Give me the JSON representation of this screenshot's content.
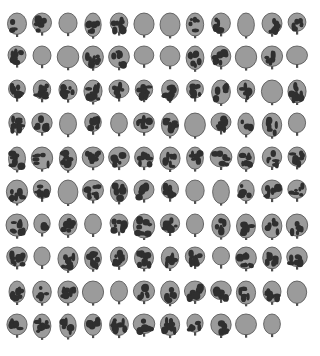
{
  "grid": {
    "columns": 12,
    "rows": 10
  },
  "colors": {
    "leaf": "#9b9b9b",
    "outline": "#4e4e4e",
    "spot": "#2f2f2f",
    "background": "#ffffff"
  },
  "leaves": [
    [
      1,
      2,
      0,
      2,
      3,
      0,
      0,
      2,
      2,
      0,
      3,
      2
    ],
    [
      3,
      0,
      0,
      3,
      3,
      0,
      0,
      3,
      3,
      0,
      2,
      0
    ],
    [
      3,
      3,
      3,
      3,
      2,
      3,
      3,
      3,
      2,
      2,
      0,
      3
    ],
    [
      3,
      2,
      0,
      3,
      0,
      3,
      3,
      0,
      3,
      1,
      2,
      0
    ],
    [
      3,
      2,
      3,
      3,
      2,
      3,
      3,
      3,
      2,
      3,
      2,
      3
    ],
    [
      2,
      2,
      0,
      3,
      2,
      3,
      3,
      0,
      0,
      2,
      3,
      2
    ],
    [
      3,
      1,
      2,
      0,
      2,
      3,
      3,
      0,
      2,
      2,
      2,
      2
    ],
    [
      3,
      0,
      3,
      3,
      3,
      3,
      2,
      3,
      0,
      3,
      3,
      2
    ],
    [
      2,
      2,
      3,
      0,
      0,
      2,
      2,
      3,
      2,
      2,
      3,
      0
    ],
    [
      2,
      3,
      2,
      2,
      3,
      2,
      3,
      2,
      2,
      0,
      0,
      -1
    ]
  ]
}
